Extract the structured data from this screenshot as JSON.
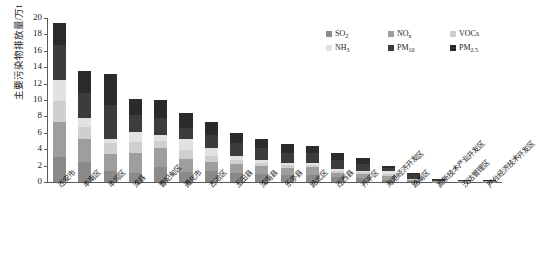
{
  "chart_data": {
    "type": "bar",
    "stacked": true,
    "title": "",
    "xlabel": "",
    "ylabel": "主要污染物排放量/万t",
    "ylim": [
      0,
      20
    ],
    "ytick_step": 2,
    "yticks": [
      "0",
      "2",
      "4",
      "6",
      "8",
      "10",
      "12",
      "14",
      "16",
      "18",
      "20"
    ],
    "grid": false,
    "legend_position": "top-right",
    "categories": [
      "迁安市",
      "丰南区",
      "丰润区",
      "滦县",
      "曹妃甸区",
      "遵化市",
      "古冶区",
      "玉田县",
      "滦南县",
      "乐亭县",
      "路北区",
      "迁西县",
      "开平区",
      "海港经济开发区",
      "路南区",
      "高新技术产业开发区",
      "汉沽管理区",
      "芦台经济技术开发区"
    ],
    "series": [
      {
        "name": "SO₂",
        "color": "#8a8a8a",
        "values": [
          3.1,
          2.45,
          1.35,
          1.1,
          1.8,
          1.25,
          1.35,
          1.05,
          0.95,
          0.85,
          0.85,
          0.6,
          0.45,
          0.28,
          0.15,
          0.06,
          0.05,
          0.04
        ]
      },
      {
        "name": "NOₓ",
        "color": "#9e9e9e",
        "values": [
          4.2,
          2.85,
          2.05,
          2.4,
          2.4,
          1.55,
          1.15,
          1.1,
          0.95,
          0.8,
          0.95,
          0.5,
          0.55,
          0.42,
          0.12,
          0.05,
          0.04,
          0.03
        ]
      },
      {
        "name": "VOCs",
        "color": "#cfcfcf",
        "values": [
          2.6,
          1.4,
          1.35,
          1.35,
          0.85,
          1.05,
          0.65,
          0.55,
          0.45,
          0.4,
          0.3,
          0.3,
          0.25,
          0.32,
          0.08,
          0.04,
          0.03,
          0.02
        ]
      },
      {
        "name": "NH₃",
        "color": "#e2e2e2",
        "values": [
          2.6,
          1.05,
          0.55,
          1.25,
          0.65,
          1.35,
          1.05,
          0.45,
          0.35,
          0.3,
          0.2,
          0.25,
          0.15,
          0.38,
          0.05,
          0.03,
          0.02,
          0.02
        ]
      },
      {
        "name": "PM₁₀",
        "color": "#3c3c3c",
        "values": [
          4.2,
          3.05,
          4.05,
          2.05,
          2.05,
          1.45,
          1.55,
          1.55,
          1.4,
          1.25,
          1.2,
          1.05,
          0.85,
          0.35,
          0.55,
          0.14,
          0.08,
          0.07
        ]
      },
      {
        "name": "PM₂.₅",
        "color": "#2b2b2b",
        "values": [
          2.7,
          2.7,
          3.85,
          1.95,
          2.2,
          1.75,
          1.55,
          1.3,
          1.2,
          1.1,
          0.9,
          0.8,
          0.65,
          0.25,
          0.15,
          0.08,
          0.05,
          0.04
        ]
      }
    ]
  },
  "legend": {
    "items": [
      {
        "label": "SO",
        "sub": "2",
        "name": "so2"
      },
      {
        "label": "NO",
        "sub": "x",
        "name": "nox"
      },
      {
        "label": "VOCs",
        "sub": "",
        "name": "vocs"
      },
      {
        "label": "NH",
        "sub": "3",
        "name": "nh3"
      },
      {
        "label": "PM",
        "sub": "10",
        "name": "pm10"
      },
      {
        "label": "PM",
        "sub": "2.5",
        "name": "pm25"
      }
    ]
  }
}
